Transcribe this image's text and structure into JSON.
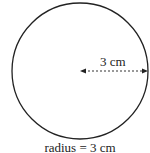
{
  "diagram": {
    "radius_label": "3 cm",
    "caption": "radius = 3 cm",
    "circle": {
      "cx": 80,
      "cy": 71,
      "r": 68,
      "stroke": "#222"
    }
  }
}
